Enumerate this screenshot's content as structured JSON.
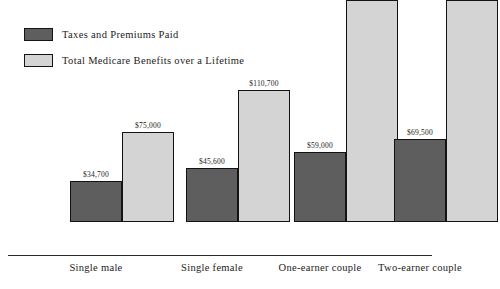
{
  "chart_data": {
    "type": "bar",
    "title": "",
    "subtitle": "",
    "xlabel": "",
    "ylabel": "",
    "ylim": [
      0,
      195000
    ],
    "grid": false,
    "legend_position": "top-left",
    "categories": [
      "Single male",
      "Single female",
      "One-earner couple",
      "Two-earner couple"
    ],
    "series": [
      {
        "name": "Taxes and Premiums Paid",
        "color": "#5e5e5e",
        "values": [
          34700,
          45600,
          59000,
          69500
        ],
        "value_labels": [
          "$34,700",
          "$45,600",
          "$59,000",
          "$69,500"
        ]
      },
      {
        "name": "Total Medicare Benefits over a Lifetime",
        "color": "#d4d4d4",
        "values": [
          75000,
          110700,
          185700,
          185700
        ],
        "value_labels": [
          "$75,000",
          "$110,700",
          "$185,700",
          "$185,700"
        ]
      }
    ]
  },
  "legend": {
    "items": [
      {
        "label": "Taxes and Premiums Paid",
        "swatch": "dark-gray-swatch"
      },
      {
        "label": "Total Medicare Benefits over a Lifetime",
        "swatch": "light-gray-swatch"
      }
    ]
  },
  "axis": {
    "baseline_visible": true
  },
  "colors": {
    "taxes_paid": "#5e5e5e",
    "benefits": "#d4d4d4",
    "bar_border": "#131313",
    "text": "#1c1c1c",
    "background": "#ffffff"
  }
}
